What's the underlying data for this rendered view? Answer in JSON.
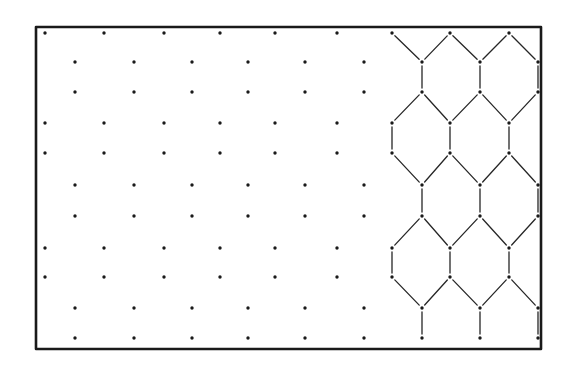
{
  "figure": {
    "colors": {
      "ink": "#1a1a1a",
      "background": "#ffffff"
    },
    "frame": {
      "x1": 36,
      "y1": 27,
      "x2": 541,
      "y2": 349
    },
    "rows_y": [
      33,
      62,
      92,
      123,
      153,
      185,
      216,
      248,
      277,
      308,
      338
    ],
    "row_pattern": [
      "A",
      "B",
      "B",
      "A",
      "A",
      "B",
      "B",
      "A",
      "A",
      "B",
      "B"
    ],
    "columns_A_x": [
      45,
      104,
      164,
      220,
      275,
      337,
      392,
      450,
      509
    ],
    "columns_B_x": [
      75,
      134,
      192,
      248,
      305,
      364,
      422,
      480,
      538
    ],
    "honeycomb_start_x": 385,
    "regions": [
      {
        "name": "dot-lattice",
        "label": "isolated points"
      },
      {
        "name": "honeycomb-network",
        "label": "connected hexagonal network"
      }
    ]
  }
}
